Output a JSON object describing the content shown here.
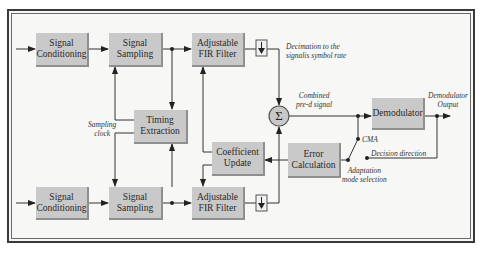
{
  "diagram": {
    "blocks": {
      "signal_conditioning_top": "Signal\nConditioning",
      "signal_sampling_top": "Signal\nSampling",
      "fir_filter_top": "Adjustable\nFIR Filter",
      "timing_extraction": "Timing\nExtraction",
      "coefficient_update": "Coefficient\nUpdate",
      "error_calculation": "Error\nCalculation",
      "demodulator": "Demodulator",
      "signal_conditioning_bottom": "Signal\nConditioning",
      "signal_sampling_bottom": "Signal\nSampling",
      "fir_filter_bottom": "Adjustable\nFIR Filter",
      "summer_symbol": "Σ"
    },
    "annotations": {
      "decimation": "Decimation to the\nsignalis symbol rate",
      "combined": "Combined\npre-d signal",
      "demod_output": "Demodulator\nOutput",
      "sampling_clock": "Sampling\nclock",
      "cma": "CMA",
      "decision_direction": "Decision direction",
      "adaptation_mode": "Adaptation\nmode selection"
    },
    "colors": {
      "block_fill": "#c9c9c9",
      "summer_fill": "#c8c8c8",
      "background": "#f7f7f5",
      "line": "#333333"
    }
  }
}
